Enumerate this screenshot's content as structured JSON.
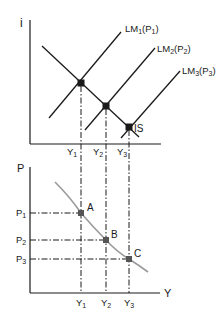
{
  "top_panel": {
    "y_axis_label": "i",
    "curves": {
      "is": "IS",
      "lm1": {
        "main": "LM",
        "sub": "1",
        "open": "(P",
        "psub": "1",
        "close": ")"
      },
      "lm2": {
        "main": "LM",
        "sub": "2",
        "open": "(P",
        "psub": "2",
        "close": ")"
      },
      "lm3": {
        "main": "LM",
        "sub": "3",
        "open": "(P",
        "psub": "3",
        "close": ")"
      }
    },
    "x_ticks": [
      {
        "main": "Y",
        "sub": "1"
      },
      {
        "main": "Y",
        "sub": "2"
      },
      {
        "main": "Y",
        "sub": "3"
      }
    ]
  },
  "bottom_panel": {
    "y_axis_label": "P",
    "x_axis_label": "Y",
    "y_ticks": [
      {
        "main": "P",
        "sub": "1"
      },
      {
        "main": "P",
        "sub": "2"
      },
      {
        "main": "P",
        "sub": "3"
      }
    ],
    "x_ticks": [
      {
        "main": "Y",
        "sub": "1"
      },
      {
        "main": "Y",
        "sub": "2"
      },
      {
        "main": "Y",
        "sub": "3"
      }
    ],
    "points": [
      "A",
      "B",
      "C"
    ]
  },
  "colors": {
    "ink": "#1a1a1a",
    "ad_curve": "#9a9a9a"
  }
}
